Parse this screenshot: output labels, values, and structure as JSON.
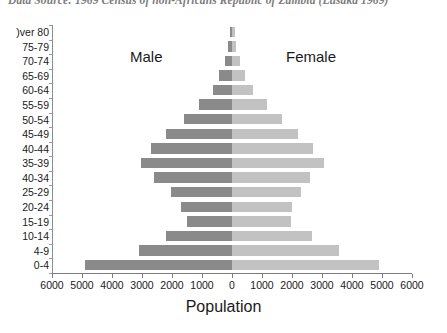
{
  "caption": "Data Source: 1969 Census of non-Africans Republic of Zambia (Lusaka 1969)",
  "labels": {
    "male": "Male",
    "female": "Female",
    "xtitle": "Population"
  },
  "colors": {
    "male_bar": "#8a8a8a",
    "female_bar": "#c2c2c2",
    "axis": "#7d7d7d",
    "text": "#1a1a1a",
    "caption": "#4a4a4a",
    "background": "#ffffff"
  },
  "chart_data": {
    "type": "bar",
    "subtype": "population-pyramid",
    "title": "",
    "xlabel": "Population",
    "ylabel": "",
    "xlim": [
      -6000,
      6000
    ],
    "grid": false,
    "legend": "in-plot",
    "orientation": "horizontal",
    "xticklabels": [
      "6000",
      "5000",
      "4000",
      "3000",
      "2000",
      "1000",
      "0",
      "1000",
      "2000",
      "3000",
      "4000",
      "5000",
      "6000"
    ],
    "xtickvalues": [
      -6000,
      -5000,
      -4000,
      -3000,
      -2000,
      -1000,
      0,
      1000,
      2000,
      3000,
      4000,
      5000,
      6000
    ],
    "categories": [
      "Over 80",
      "75-79",
      "70-74",
      "65-69",
      "60-64",
      "55-59",
      "50-54",
      "45-49",
      "40-44",
      "35-39",
      "40-34",
      "25-29",
      "20-24",
      "15-19",
      "10-14",
      "4-9",
      "0-4"
    ],
    "categories_display": [
      ")ver 80",
      "75-79",
      "70-74",
      "65-69",
      "60-64",
      "55-59",
      "50-54",
      "45-49",
      "40-44",
      "35-39",
      "40-34",
      "25-29",
      "20-24",
      "15-19",
      "10-14",
      "4-9",
      "0-4"
    ],
    "series": [
      {
        "name": "Male",
        "side": "left",
        "values": [
          70,
          130,
          240,
          420,
          620,
          1100,
          1600,
          2200,
          2700,
          3050,
          2600,
          2050,
          1700,
          1500,
          2200,
          3100,
          4900
        ]
      },
      {
        "name": "Female",
        "side": "right",
        "values": [
          90,
          140,
          260,
          430,
          700,
          1150,
          1650,
          2200,
          2700,
          3050,
          2600,
          2300,
          2000,
          1950,
          2650,
          3550,
          4900
        ]
      }
    ]
  }
}
